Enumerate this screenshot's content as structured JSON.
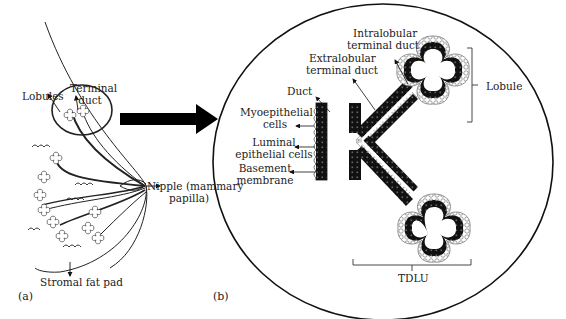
{
  "figure": {
    "panel_a": {
      "tag": "(a)",
      "labels": {
        "lobules": "Lobules",
        "terminal_duct_1": "Terminal",
        "terminal_duct_2": "duct",
        "nipple_1": "Nipple (mammary",
        "nipple_2": "papilla)",
        "stromal": "Stromal fat pad"
      }
    },
    "panel_b": {
      "tag": "(b)",
      "labels": {
        "intralobular_1": "Intralobular",
        "intralobular_2": "terminal duct",
        "extralobular_1": "Extralobular",
        "extralobular_2": "terminal duct",
        "duct": "Duct",
        "myo_1": "Myoepithelial",
        "myo_2": "cells",
        "luminal_1": "Luminal",
        "luminal_2": "epithelial cells",
        "basement_1": "Basement",
        "basement_2": "membrane",
        "lobule": "Lobule",
        "tdlu": "TDLU"
      }
    },
    "colors": {
      "ink": "#111111",
      "text": "#222222",
      "background": "#ffffff",
      "stipple": "#9a9a9a"
    }
  }
}
